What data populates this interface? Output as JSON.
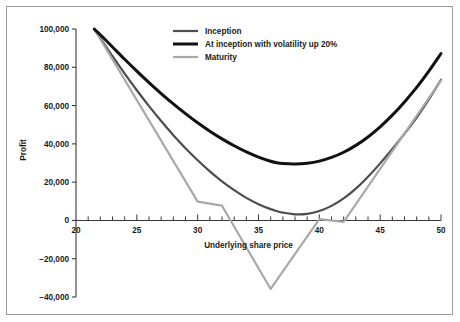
{
  "figure": {
    "background_color": "#ffffff",
    "border_color": "#9a9a9a"
  },
  "chart_data": {
    "type": "line",
    "title": "",
    "xlabel": "Underlying share price",
    "ylabel": "Profit",
    "xlim": [
      20,
      50
    ],
    "ylim": [
      -40000,
      100000
    ],
    "xticks": [
      20,
      25,
      30,
      35,
      40,
      45,
      50
    ],
    "xtick_labels": [
      "20",
      "25",
      "30",
      "35",
      "40",
      "45",
      "50"
    ],
    "x_minor_tick_step": 1,
    "yticks": [
      -40000,
      -20000,
      0,
      20000,
      40000,
      60000,
      80000,
      100000
    ],
    "ytick_labels": [
      "−40,000",
      "−20,000",
      "0",
      "20,000",
      "40,000",
      "60,000",
      "80,000",
      "100,000"
    ],
    "grid": false,
    "legend_position": "upper center",
    "series": [
      {
        "name": "Inception",
        "color": "#4d4d4d",
        "width": 2.2,
        "x": [
          21.5,
          22,
          23,
          24,
          25,
          26,
          27,
          28,
          29,
          30,
          31,
          32,
          33,
          34,
          35,
          36,
          36.5,
          37,
          38,
          39,
          40,
          41,
          42,
          43,
          44,
          45,
          46,
          47,
          48,
          49,
          50
        ],
        "y": [
          100000,
          95200,
          85800,
          76700,
          68000,
          59700,
          51900,
          44500,
          37700,
          31400,
          25600,
          20400,
          15800,
          11800,
          8500,
          5900,
          4900,
          4100,
          3200,
          3400,
          4900,
          7600,
          11500,
          16600,
          22800,
          29800,
          37300,
          45300,
          53700,
          63200,
          73500
        ]
      },
      {
        "name": "At inception with volatility up 20%",
        "color": "#111111",
        "width": 3.0,
        "x": [
          21.5,
          22,
          23,
          24,
          25,
          26,
          27,
          28,
          29,
          30,
          31,
          32,
          33,
          34,
          35,
          36,
          36.5,
          37,
          38,
          39,
          40,
          41,
          42,
          43,
          44,
          45,
          46,
          47,
          48,
          49,
          50
        ],
        "y": [
          100000,
          97000,
          90600,
          84200,
          78000,
          72000,
          66300,
          60900,
          55800,
          51000,
          46600,
          42600,
          39000,
          35800,
          33100,
          30900,
          30100,
          29700,
          29500,
          29900,
          31000,
          32900,
          35600,
          39200,
          43600,
          48900,
          55000,
          61900,
          69500,
          78000,
          87200
        ]
      },
      {
        "name": "Maturity",
        "color": "#a8a8a8",
        "width": 2.2,
        "x": [
          21.5,
          30,
          32,
          36,
          40,
          42,
          50
        ],
        "y": [
          100000,
          9800,
          7700,
          -35800,
          700,
          -800,
          73200
        ]
      }
    ]
  },
  "legend": {
    "items": [
      {
        "label": "Inception",
        "color": "#4d4d4d",
        "thickness": "2.2"
      },
      {
        "label": "At inception with volatility up 20%",
        "color": "#111111",
        "thickness": "3.0"
      },
      {
        "label": "Maturity",
        "color": "#a8a8a8",
        "thickness": "2.2"
      }
    ]
  }
}
